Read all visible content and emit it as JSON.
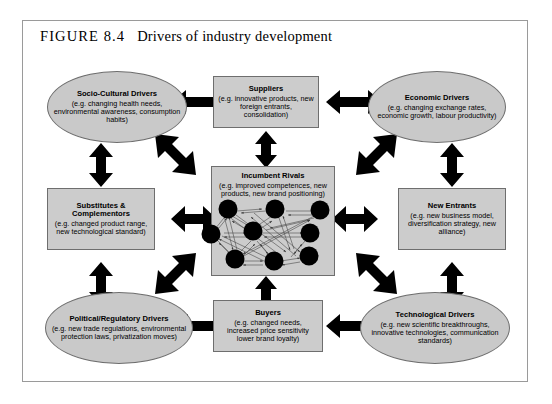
{
  "figure": {
    "number": "FIGURE 8.4",
    "title": "Drivers of industry development"
  },
  "diagram": {
    "type": "influence-diagram",
    "center": {
      "shape": "rectangle",
      "heading": "Incumbent Rivals",
      "body": "(e.g. improved competences, new products, new brand positioning)"
    },
    "nodes": [
      {
        "id": "socio-cultural-drivers",
        "shape": "ellipse",
        "position": "top-left",
        "heading": "Socio-Cultural Drivers",
        "body": "(e.g. changing health needs, environmental awareness, consumption habits)"
      },
      {
        "id": "suppliers",
        "shape": "rectangle",
        "position": "top-center",
        "heading": "Suppliers",
        "body": "(e.g. innovative products, new foreign entrants, consolidation)"
      },
      {
        "id": "economic-drivers",
        "shape": "ellipse",
        "position": "top-right",
        "heading": "Economic Drivers",
        "body": "(e.g. changing exchange rates, economic growth, labour productivity)"
      },
      {
        "id": "substitutes-complementors",
        "shape": "rectangle",
        "position": "middle-left",
        "heading": "Substitutes & Complementors",
        "body": "(e.g. changed product range, new technological standard)"
      },
      {
        "id": "new-entrants",
        "shape": "rectangle",
        "position": "middle-right",
        "heading": "New Entrants",
        "body": "(e.g. new business model, diversification strategy, new alliance)"
      },
      {
        "id": "political-regulatory-drivers",
        "shape": "ellipse",
        "position": "bottom-left",
        "heading": "Political/Regulatory Drivers",
        "body": "(e.g. new trade regulations, environmental protection laws, privatization moves)"
      },
      {
        "id": "buyers",
        "shape": "rectangle",
        "position": "bottom-center",
        "heading": "Buyers",
        "body": "(e.g. changed needs, increased price sensitivity lower brand loyalty)"
      },
      {
        "id": "technological-drivers",
        "shape": "ellipse",
        "position": "bottom-right",
        "heading": "Technological Drivers",
        "body": "(e.g. new scientific breakthroughs, innovative technologies, communication standards)"
      }
    ],
    "connections": [
      {
        "from": "socio-cultural-drivers",
        "to": "suppliers",
        "style": "double-headed"
      },
      {
        "from": "suppliers",
        "to": "economic-drivers",
        "style": "double-headed"
      },
      {
        "from": "socio-cultural-drivers",
        "to": "substitutes-complementors",
        "style": "double-headed"
      },
      {
        "from": "economic-drivers",
        "to": "new-entrants",
        "style": "double-headed"
      },
      {
        "from": "substitutes-complementors",
        "to": "political-regulatory-drivers",
        "style": "double-headed"
      },
      {
        "from": "new-entrants",
        "to": "technological-drivers",
        "style": "double-headed"
      },
      {
        "from": "political-regulatory-drivers",
        "to": "buyers",
        "style": "double-headed"
      },
      {
        "from": "buyers",
        "to": "technological-drivers",
        "style": "double-headed"
      },
      {
        "from": "suppliers",
        "to": "center",
        "style": "double-headed"
      },
      {
        "from": "buyers",
        "to": "center",
        "style": "double-headed"
      },
      {
        "from": "substitutes-complementors",
        "to": "center",
        "style": "double-headed"
      },
      {
        "from": "new-entrants",
        "to": "center",
        "style": "double-headed"
      },
      {
        "from": "socio-cultural-drivers",
        "to": "center",
        "style": "double-headed-diagonal"
      },
      {
        "from": "economic-drivers",
        "to": "center",
        "style": "double-headed-diagonal"
      },
      {
        "from": "political-regulatory-drivers",
        "to": "center",
        "style": "double-headed-diagonal"
      },
      {
        "from": "technological-drivers",
        "to": "center",
        "style": "double-headed-diagonal"
      }
    ],
    "network": {
      "description": "rivalry network of interconnected firms inside Incumbent Rivals box",
      "node_count": 9,
      "node_color": "#000000"
    }
  },
  "colors": {
    "node_fill": "#c9c9c9",
    "node_border": "#6e6e6e",
    "arrow": "#000000",
    "frame": "#9a9a9a",
    "page": "#ffffff"
  }
}
